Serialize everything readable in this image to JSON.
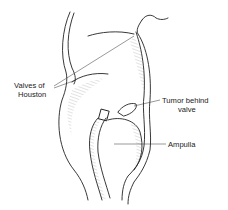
{
  "diagram": {
    "labels": {
      "valves": [
        "Valves of",
        "Houston"
      ],
      "tumor": [
        "Tumor behind",
        "valve"
      ],
      "ampulla": "Ampulla"
    },
    "colors": {
      "ink": "#222222",
      "background": "#ffffff"
    }
  }
}
